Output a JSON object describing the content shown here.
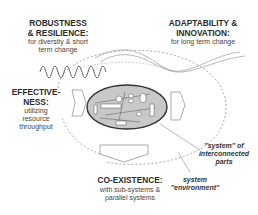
{
  "diagram": {
    "robustness": {
      "title1": "ROBUSTNESS",
      "title2": "& RESILIENCE:",
      "sub1": "for diversity & short",
      "sub2": "term change"
    },
    "adaptability": {
      "title1": "ADAPTABILITY &",
      "title2": "INNOVATION:",
      "sub1": "for long term change"
    },
    "effectiveness": {
      "title1": "EFFECTIVE-",
      "title2": "NESS:",
      "sub1": "utilizing",
      "sub2": "resource",
      "sub3": "throughput"
    },
    "coexistence": {
      "title1": "CO-EXISTENCE:",
      "sub1": "with sub-systems &",
      "sub2": "parallel systems"
    },
    "system_parts": {
      "line1": "\"system\" of",
      "line2": "interconnected",
      "line3": "parts"
    },
    "system_env": {
      "line1": "system",
      "line2": "\"environment\""
    },
    "colors": {
      "ellipse_fill": "#c8c8c8",
      "ellipse_stroke": "#333333",
      "line": "#888888"
    }
  }
}
